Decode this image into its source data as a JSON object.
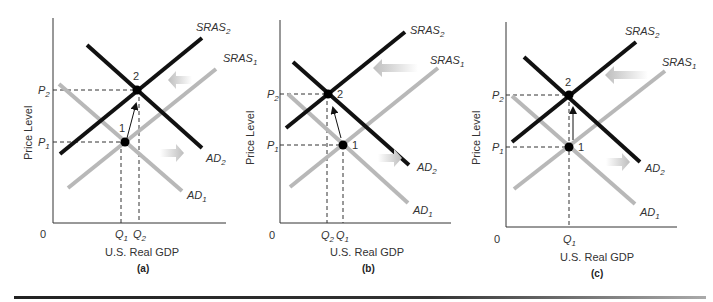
{
  "figure": {
    "panels": [
      {
        "id": "a",
        "caption": "(a)",
        "ylabel": "Price Level",
        "xlabel": "U.S. Real GDP",
        "origin": "0",
        "p1": "P",
        "p1_sub": "1",
        "p2": "P",
        "p2_sub": "2",
        "q_labels": [
          {
            "t": "Q",
            "s": "1"
          },
          {
            "t": "Q",
            "s": "2"
          }
        ],
        "point1": "1",
        "point2": "2",
        "sras1": "SRAS",
        "sras1_sub": "1",
        "sras2": "SRAS",
        "sras2_sub": "2",
        "ad1": "AD",
        "ad1_sub": "1",
        "ad2": "AD",
        "ad2_sub": "2"
      },
      {
        "id": "b",
        "caption": "(b)",
        "ylabel": "Price Level",
        "xlabel": "U.S. Real GDP",
        "origin": "0",
        "p1": "P",
        "p1_sub": "1",
        "p2": "P",
        "p2_sub": "2",
        "q_labels": [
          {
            "t": "Q",
            "s": "2"
          },
          {
            "t": "Q",
            "s": "1"
          }
        ],
        "point1": "1",
        "point2": "2",
        "sras1": "SRAS",
        "sras1_sub": "1",
        "sras2": "SRAS",
        "sras2_sub": "2",
        "ad1": "AD",
        "ad1_sub": "1",
        "ad2": "AD",
        "ad2_sub": "2"
      },
      {
        "id": "c",
        "caption": "(c)",
        "ylabel": "Price Level",
        "xlabel": "U.S. Real GDP",
        "origin": "0",
        "p1": "P",
        "p1_sub": "1",
        "p2": "P",
        "p2_sub": "2",
        "q_labels": [
          {
            "t": "Q",
            "s": "1"
          }
        ],
        "point1": "1",
        "point2": "2",
        "sras1": "SRAS",
        "sras1_sub": "1",
        "sras2": "SRAS",
        "sras2_sub": "2",
        "ad1": "AD",
        "ad1_sub": "1",
        "ad2": "AD",
        "ad2_sub": "2"
      }
    ],
    "colors": {
      "shifted_curve": "#111111",
      "original_curve": "#b8b8b8",
      "shift_arrow": "#c8c8c8",
      "axis": "#333333"
    }
  }
}
